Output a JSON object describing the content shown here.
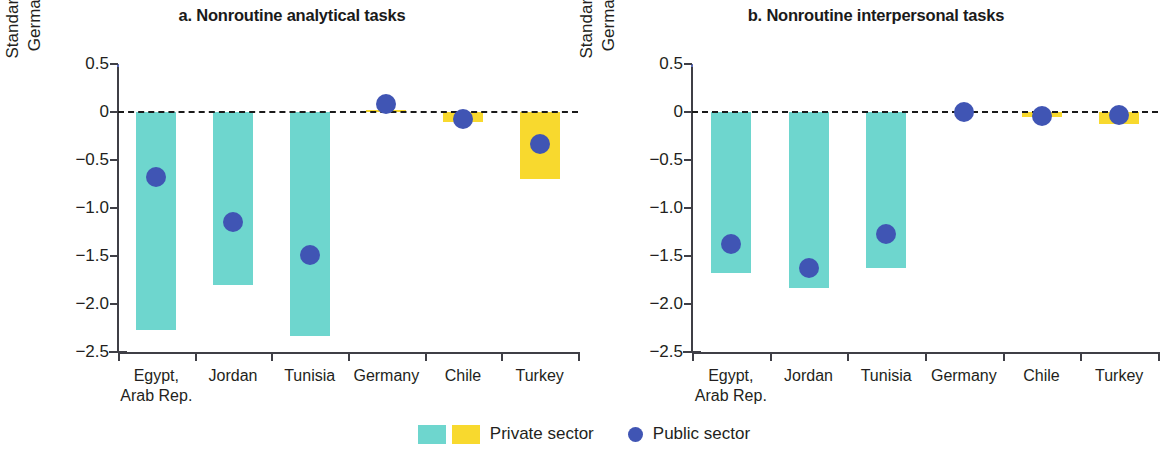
{
  "chart_data": [
    {
      "type": "bar",
      "panel": "a",
      "title": "a. Nonroutine analytical tasks",
      "xlabel": "",
      "ylabel": "Standard deviations from\nGermany's mean value",
      "categories": [
        "Egypt,\nArab Rep.",
        "Jordan",
        "Tunisia",
        "Germany",
        "Chile",
        "Turkey"
      ],
      "ylim": [
        -2.5,
        0.5
      ],
      "yticks": [
        0.5,
        0,
        -0.5,
        -1.0,
        -1.5,
        -2.0,
        -2.5
      ],
      "ytick_labels": [
        "0.5",
        "0",
        "−0.5",
        "−1.0",
        "−1.5",
        "−2.0",
        "−2.5"
      ],
      "grid": false,
      "zero_reference_line": true,
      "legend_position": "bottom-center",
      "series": [
        {
          "name": "Private sector",
          "type": "bar",
          "values": [
            -2.27,
            -1.8,
            -2.33,
            0.02,
            -0.1,
            -0.7
          ],
          "colors": [
            "teal",
            "teal",
            "teal",
            "yellow",
            "yellow",
            "yellow"
          ]
        },
        {
          "name": "Public sector",
          "type": "scatter",
          "values": [
            -0.68,
            -1.15,
            -1.49,
            0.08,
            -0.07,
            -0.33
          ]
        }
      ]
    },
    {
      "type": "bar",
      "panel": "b",
      "title": "b. Nonroutine interpersonal tasks",
      "xlabel": "",
      "ylabel": "Standard deviations from\nGermany's mean value",
      "categories": [
        "Egypt,\nArab Rep.",
        "Jordan",
        "Tunisia",
        "Germany",
        "Chile",
        "Turkey"
      ],
      "ylim": [
        -2.5,
        0.5
      ],
      "yticks": [
        0.5,
        0,
        -0.5,
        -1.0,
        -1.5,
        -2.0,
        -2.5
      ],
      "ytick_labels": [
        "0.5",
        "0",
        "−0.5",
        "−1.0",
        "−1.5",
        "−2.0",
        "−2.5"
      ],
      "grid": false,
      "zero_reference_line": true,
      "legend_position": "bottom-center",
      "series": [
        {
          "name": "Private sector",
          "type": "bar",
          "values": [
            -1.68,
            -1.83,
            -1.62,
            0.0,
            -0.05,
            -0.12
          ],
          "colors": [
            "teal",
            "teal",
            "teal",
            "yellow",
            "yellow",
            "yellow"
          ]
        },
        {
          "name": "Public sector",
          "type": "scatter",
          "values": [
            -1.37,
            -1.62,
            -1.27,
            0.0,
            -0.04,
            -0.03
          ]
        }
      ]
    }
  ],
  "colors": {
    "private_teal": "#6ed6ce",
    "private_yellow": "#f8d92e",
    "public_blue": "#4055b4",
    "axis": "#3f3f46",
    "text": "#231f20"
  },
  "panel_a": {
    "title": "a. Nonroutine analytical tasks",
    "ylabel_line1": "Standard deviations from",
    "ylabel_line2": "Germany's mean value",
    "yticks": [
      "0.5",
      "0",
      "−0.5",
      "−1.0",
      "−1.5",
      "−2.0",
      "−2.5"
    ],
    "categories": [
      "Egypt,\nArab Rep.",
      "Jordan",
      "Tunisia",
      "Germany",
      "Chile",
      "Turkey"
    ]
  },
  "panel_b": {
    "title": "b. Nonroutine interpersonal tasks",
    "ylabel_line1": "Standard deviations from",
    "ylabel_line2": "Germany's mean value",
    "yticks": [
      "0.5",
      "0",
      "−0.5",
      "−1.0",
      "−1.5",
      "−2.0",
      "−2.5"
    ],
    "categories": [
      "Egypt,\nArab Rep.",
      "Jordan",
      "Tunisia",
      "Germany",
      "Chile",
      "Turkey"
    ]
  },
  "legend": {
    "private_label": "Private sector",
    "public_label": "Public sector"
  }
}
